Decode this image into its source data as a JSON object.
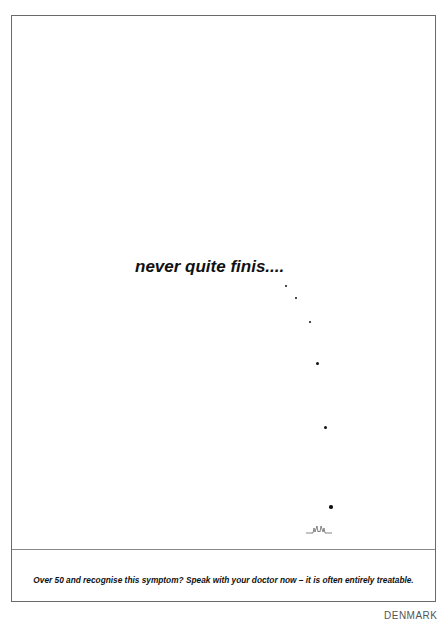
{
  "advert": {
    "headline": "never quite finis....",
    "tagline": "Over 50 and recognise this symptom? Speak with your doctor now – it is often entirely treatable.",
    "country": "DENMARK",
    "drips": [
      {
        "x": 286,
        "y": 286,
        "size": 2
      },
      {
        "x": 296,
        "y": 298,
        "size": 2
      },
      {
        "x": 310,
        "y": 322,
        "size": 2.5
      },
      {
        "x": 317,
        "y": 363,
        "size": 3
      },
      {
        "x": 325,
        "y": 427,
        "size": 3
      },
      {
        "x": 331,
        "y": 507,
        "size": 3.5
      }
    ],
    "splash_icon": "droplet-splash-icon",
    "colors": {
      "ink": "#111111",
      "frame": "#6a6a6a",
      "background": "#ffffff"
    }
  }
}
